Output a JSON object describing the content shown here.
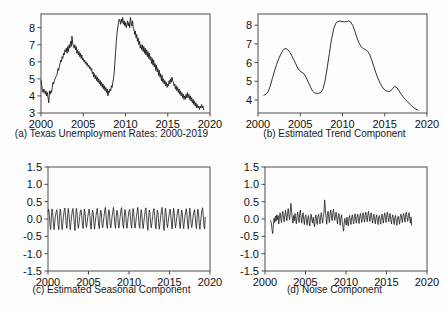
{
  "figure": {
    "background": "#fdfdfd",
    "line_color": "#1a1a1a",
    "axis_color": "#4c4c4c"
  },
  "panels": {
    "a": {
      "caption": "(a) Texas Unemployment Rates: 2000-2019"
    },
    "b": {
      "caption": "(b) Estimated Trend Component"
    },
    "c": {
      "caption": "(c) Estimated Seasonal Component"
    },
    "d": {
      "caption": "(d) Noise Component"
    }
  },
  "axis_labels": {
    "x_ticks_years": [
      "2000",
      "2005",
      "2010",
      "2015",
      "2020"
    ],
    "y_ticks_rate": [
      "8",
      "7",
      "6",
      "5",
      "4",
      "3"
    ],
    "y_ticks_component": [
      "1.5",
      "1.0",
      "0.5",
      "0.0",
      "-0.5",
      "-1.0",
      "-1.5"
    ]
  },
  "chart_data": [
    {
      "type": "line",
      "panel": "a",
      "title": "(a) Texas Unemployment Rates: 2000-2019",
      "xlabel": "",
      "ylabel": "",
      "xlim": [
        2000.0,
        2020.0
      ],
      "ylim": [
        3.0,
        8.8
      ],
      "grid": false,
      "legend": "none",
      "xticks": [
        2000,
        2005,
        2010,
        2015,
        2020
      ],
      "yticks": [
        3,
        4,
        5,
        6,
        7,
        8
      ],
      "x_start": 2000.0,
      "x_step": 0.08333,
      "values": [
        4.9,
        4.6,
        4.3,
        4.2,
        4.4,
        4.3,
        4.1,
        4.3,
        4.0,
        4.2,
        3.9,
        3.6,
        4.3,
        4.1,
        4.3,
        4.2,
        4.5,
        4.8,
        4.7,
        4.9,
        5.0,
        5.1,
        5.2,
        5.3,
        5.6,
        5.5,
        5.7,
        5.9,
        6.1,
        6.0,
        6.3,
        6.2,
        6.5,
        6.4,
        6.7,
        6.6,
        6.8,
        6.5,
        6.9,
        6.6,
        7.0,
        6.8,
        7.2,
        6.9,
        7.5,
        7.1,
        6.9,
        6.8,
        7.0,
        6.7,
        6.9,
        6.5,
        6.7,
        6.4,
        6.6,
        6.3,
        6.5,
        6.2,
        6.4,
        6.1,
        6.2,
        6.0,
        6.1,
        5.9,
        6.0,
        5.8,
        5.9,
        5.7,
        5.8,
        5.6,
        5.7,
        5.5,
        5.6,
        5.3,
        5.4,
        5.1,
        5.3,
        5.0,
        5.2,
        4.9,
        5.1,
        4.8,
        5.0,
        4.7,
        4.9,
        4.6,
        4.8,
        4.5,
        4.7,
        4.4,
        4.6,
        4.3,
        4.5,
        4.2,
        4.4,
        4.0,
        4.3,
        4.2,
        4.4,
        4.3,
        4.6,
        4.5,
        4.8,
        5.0,
        5.4,
        6.0,
        6.6,
        7.2,
        7.7,
        8.0,
        8.3,
        8.5,
        8.4,
        8.2,
        8.5,
        8.3,
        8.6,
        8.2,
        8.4,
        8.1,
        8.3,
        8.0,
        8.2,
        8.4,
        8.1,
        8.3,
        8.0,
        8.6,
        8.3,
        8.1,
        8.4,
        8.0,
        7.9,
        7.6,
        7.8,
        7.4,
        7.6,
        7.2,
        7.4,
        7.0,
        7.2,
        6.8,
        7.0,
        6.7,
        7.0,
        6.6,
        6.9,
        6.5,
        6.8,
        6.4,
        6.7,
        6.3,
        6.6,
        6.2,
        6.5,
        6.1,
        6.3,
        5.9,
        6.2,
        5.8,
        6.1,
        5.7,
        5.9,
        5.5,
        5.8,
        5.4,
        5.6,
        5.2,
        5.5,
        5.1,
        5.3,
        4.9,
        5.2,
        4.8,
        5.0,
        4.7,
        4.9,
        4.6,
        4.8,
        4.5,
        4.7,
        4.6,
        4.9,
        4.7,
        5.0,
        4.8,
        5.1,
        4.9,
        4.8,
        4.6,
        4.7,
        4.4,
        4.6,
        4.3,
        4.5,
        4.2,
        4.4,
        4.1,
        4.3,
        4.0,
        4.2,
        3.9,
        4.1,
        3.8,
        4.0,
        3.8,
        4.1,
        3.9,
        4.2,
        3.9,
        4.1,
        3.8,
        4.0,
        3.7,
        3.9,
        3.6,
        3.8,
        3.5,
        3.7,
        3.4,
        3.6,
        3.3,
        3.5,
        3.3,
        3.4,
        3.2,
        3.4,
        3.3,
        3.5,
        3.3,
        3.4,
        3.2
      ]
    },
    {
      "type": "line",
      "panel": "b",
      "title": "(b) Estimated Trend Component",
      "xlabel": "",
      "ylabel": "",
      "xlim": [
        2000.0,
        2020.0
      ],
      "ylim": [
        3.3,
        8.6
      ],
      "grid": false,
      "legend": "none",
      "xticks": [
        2000,
        2005,
        2010,
        2015,
        2020
      ],
      "yticks": [
        4,
        5,
        6,
        7,
        8
      ],
      "x_start": 2000.7,
      "x_step": 0.25,
      "values": [
        4.25,
        4.3,
        4.45,
        4.75,
        5.15,
        5.55,
        5.9,
        6.2,
        6.45,
        6.65,
        6.75,
        6.72,
        6.6,
        6.4,
        6.18,
        5.95,
        5.7,
        5.55,
        5.48,
        5.4,
        5.2,
        4.95,
        4.7,
        4.48,
        4.38,
        4.35,
        4.36,
        4.4,
        4.6,
        5.05,
        5.75,
        6.5,
        7.25,
        7.8,
        8.1,
        8.2,
        8.22,
        8.2,
        8.18,
        8.2,
        8.22,
        8.18,
        8.0,
        7.7,
        7.35,
        7.05,
        6.85,
        6.75,
        6.7,
        6.62,
        6.45,
        6.15,
        5.8,
        5.45,
        5.15,
        4.9,
        4.7,
        4.55,
        4.48,
        4.45,
        4.48,
        4.62,
        4.72,
        4.65,
        4.48,
        4.3,
        4.15,
        4.02,
        3.9,
        3.78,
        3.68,
        3.58,
        3.5,
        3.45
      ]
    },
    {
      "type": "line",
      "panel": "c",
      "title": "(c) Estimated Seasonal Component",
      "xlabel": "",
      "ylabel": "",
      "xlim": [
        2000.0,
        2020.0
      ],
      "ylim": [
        -1.5,
        1.5
      ],
      "grid": false,
      "legend": "none",
      "xticks": [
        2000,
        2005,
        2010,
        2015,
        2020
      ],
      "yticks": [
        -1.5,
        -1.0,
        -0.5,
        0.0,
        0.5,
        1.0,
        1.5
      ],
      "x_start": 2000.0,
      "x_step": 0.08333,
      "seasonal_pattern": [
        0.22,
        0.3,
        0.1,
        -0.18,
        -0.3,
        0.05,
        0.28,
        0.18,
        -0.12,
        -0.28,
        -0.1,
        0.08
      ],
      "amplitude": 0.33,
      "period_months": 12,
      "n_points": 234
    },
    {
      "type": "line",
      "panel": "d",
      "title": "(d) Noise Component",
      "xlabel": "",
      "ylabel": "",
      "xlim": [
        2000.0,
        2020.0
      ],
      "ylim": [
        -1.5,
        1.5
      ],
      "grid": false,
      "legend": "none",
      "xticks": [
        2000,
        2005,
        2010,
        2015,
        2020
      ],
      "yticks": [
        -1.5,
        -1.0,
        -0.5,
        0.0,
        0.5,
        1.0,
        1.5
      ],
      "x_start": 2000.7,
      "x_step": 0.08333,
      "values": [
        -0.05,
        -0.12,
        -0.3,
        -0.42,
        -0.18,
        0.02,
        -0.1,
        0.08,
        -0.06,
        0.12,
        -0.02,
        0.1,
        -0.14,
        0.05,
        0.18,
        0.02,
        -0.1,
        0.12,
        0.22,
        0.06,
        -0.08,
        0.1,
        0.25,
        0.08,
        -0.05,
        0.15,
        0.3,
        0.12,
        -0.02,
        0.18,
        0.45,
        0.2,
        0.02,
        -0.12,
        0.1,
        -0.05,
        0.16,
        0.02,
        -0.14,
        0.08,
        0.2,
        0.04,
        -0.1,
        0.14,
        0.26,
        0.05,
        -0.12,
        0.08,
        0.18,
        -0.02,
        -0.16,
        0.06,
        0.12,
        -0.04,
        -0.18,
        0.02,
        0.1,
        -0.08,
        -0.2,
        0.04,
        0.14,
        -0.02,
        -0.12,
        0.05,
        -0.1,
        -0.22,
        0.02,
        0.12,
        -0.05,
        -0.16,
        0.06,
        0.14,
        -0.02,
        -0.14,
        0.05,
        0.18,
        0.02,
        -0.12,
        0.08,
        0.2,
        0.55,
        0.28,
        0.05,
        -0.15,
        0.1,
        0.22,
        0.06,
        -0.1,
        0.14,
        0.26,
        0.08,
        -0.05,
        0.16,
        0.28,
        0.1,
        -0.04,
        0.12,
        0.2,
        0.02,
        -0.14,
        0.06,
        0.16,
        -0.02,
        -0.18,
        0.04,
        0.12,
        -0.06,
        -0.22,
        -0.35,
        -0.12,
        0.02,
        -0.1,
        -0.18,
        0.05,
        -0.08,
        -0.2,
        0.03,
        0.1,
        -0.06,
        -0.16,
        0.04,
        0.12,
        -0.04,
        -0.14,
        0.06,
        0.15,
        -0.02,
        -0.12,
        0.05,
        0.14,
        -0.03,
        -0.13,
        0.06,
        0.16,
        0.02,
        -0.1,
        0.08,
        0.18,
        0.03,
        -0.09,
        0.1,
        0.2,
        0.04,
        -0.08,
        0.12,
        0.22,
        0.05,
        -0.07,
        0.1,
        0.18,
        0.02,
        -0.12,
        0.06,
        0.14,
        -0.02,
        -0.14,
        0.04,
        0.12,
        -0.05,
        -0.16,
        0.03,
        0.1,
        -0.04,
        -0.15,
        0.05,
        0.14,
        -0.02,
        -0.12,
        0.08,
        0.18,
        0.02,
        -0.1,
        0.12,
        0.2,
        0.04,
        -0.08,
        0.1,
        0.16,
        -0.02,
        -0.14,
        0.05,
        0.12,
        -0.04,
        -0.16,
        0.04,
        0.1,
        -0.06,
        -0.18,
        0.02,
        0.08,
        -0.05,
        -0.15,
        0.06,
        0.14,
        0.02,
        -0.1,
        0.08,
        0.16,
        0.03,
        -0.09,
        0.12,
        0.2,
        0.05,
        -0.07,
        0.1,
        0.18,
        0.02,
        -0.12,
        0.06,
        -0.18
      ]
    }
  ]
}
